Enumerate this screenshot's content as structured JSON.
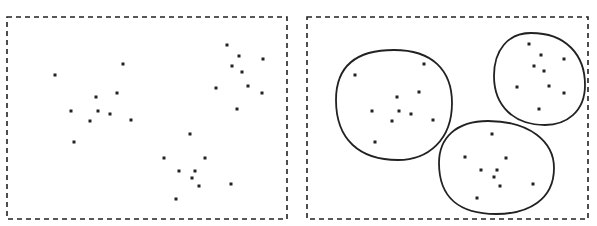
{
  "diagram": {
    "panels": [
      {
        "name": "unclustered",
        "frame": {
          "x": 7,
          "y": 17,
          "w": 280,
          "h": 202
        },
        "points": [
          [
            55,
            75
          ],
          [
            123,
            64
          ],
          [
            96,
            97
          ],
          [
            117,
            93
          ],
          [
            71,
            111
          ],
          [
            98,
            111
          ],
          [
            110,
            114
          ],
          [
            90,
            121
          ],
          [
            131,
            120
          ],
          [
            74,
            142
          ],
          [
            227,
            45
          ],
          [
            239,
            56
          ],
          [
            232,
            66
          ],
          [
            242,
            72
          ],
          [
            263,
            59
          ],
          [
            216,
            88
          ],
          [
            248,
            86
          ],
          [
            262,
            93
          ],
          [
            237,
            109
          ],
          [
            190,
            134
          ],
          [
            164,
            158
          ],
          [
            205,
            158
          ],
          [
            179,
            171
          ],
          [
            195,
            171
          ],
          [
            192,
            178
          ],
          [
            199,
            186
          ],
          [
            231,
            184
          ],
          [
            176,
            199
          ]
        ]
      },
      {
        "name": "clustered",
        "frame": {
          "x": 307,
          "y": 17,
          "w": 281,
          "h": 202
        },
        "points": [
          [
            355,
            75
          ],
          [
            424,
            64
          ],
          [
            397,
            97
          ],
          [
            419,
            92
          ],
          [
            372,
            111
          ],
          [
            399,
            111
          ],
          [
            411,
            114
          ],
          [
            392,
            121
          ],
          [
            433,
            120
          ],
          [
            375,
            142
          ],
          [
            529,
            44
          ],
          [
            541,
            55
          ],
          [
            534,
            66
          ],
          [
            544,
            71
          ],
          [
            564,
            59
          ],
          [
            517,
            87
          ],
          [
            549,
            86
          ],
          [
            564,
            93
          ],
          [
            539,
            109
          ],
          [
            492,
            134
          ],
          [
            465,
            157
          ],
          [
            506,
            158
          ],
          [
            481,
            170
          ],
          [
            497,
            170
          ],
          [
            494,
            177
          ],
          [
            500,
            186
          ],
          [
            533,
            184
          ],
          [
            477,
            198
          ]
        ],
        "clusters": [
          {
            "name": "cluster-1",
            "path": "M 394 50 C 432 50 452 70 452 103 C 452 140 428 160 398 160 C 360 160 336 140 336 100 C 336 66 356 50 394 50 Z"
          },
          {
            "name": "cluster-2",
            "path": "M 531 33 C 566 33 585 55 585 85 C 585 112 566 125 545 125 C 514 125 494 106 494 76 C 494 50 508 33 531 33 Z"
          },
          {
            "name": "cluster-3",
            "path": "M 488 121 C 530 121 554 142 554 168 C 554 200 528 214 496 214 C 460 214 439 198 439 163 C 439 138 456 121 488 121 Z"
          }
        ]
      }
    ],
    "colors": {
      "ink": "#222222",
      "background": "#ffffff"
    }
  }
}
